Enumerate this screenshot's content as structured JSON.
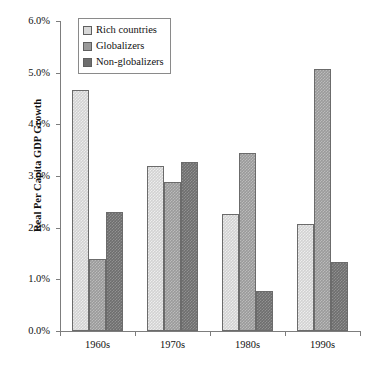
{
  "header": {
    "clipped_fragments": [
      "• •",
      "••",
      "• •"
    ]
  },
  "legend": {
    "position": "top-left-inside",
    "items": [
      {
        "label": "Rich countries",
        "color": "#d8d8d8"
      },
      {
        "label": "Globalizers",
        "color": "#9a9a9a"
      },
      {
        "label": "Non-globalizers",
        "color": "#6e6e6e"
      }
    ]
  },
  "axis": {
    "y_title": "Real Per Capita GDP Growth",
    "y_ticks": [
      "0.0%",
      "1.0%",
      "2.0%",
      "3.0%",
      "4.0%",
      "5.0%",
      "6.0%"
    ],
    "x_ticks": [
      "1960s",
      "1970s",
      "1980s",
      "1990s"
    ]
  },
  "chart_data": {
    "type": "bar",
    "title": "",
    "subtitle": "",
    "xlabel": "",
    "ylabel": "Real Per Capita GDP Growth",
    "categories": [
      "1960s",
      "1970s",
      "1980s",
      "1990s"
    ],
    "series": [
      {
        "name": "Rich countries",
        "color": "#d2d2d2",
        "values": [
          4.66,
          3.19,
          2.27,
          2.07
        ]
      },
      {
        "name": "Globalizers",
        "color": "#9a9a9a",
        "values": [
          1.39,
          2.89,
          3.45,
          5.07
        ]
      },
      {
        "name": "Non-globalizers",
        "color": "#6e6e6e",
        "values": [
          2.3,
          3.27,
          0.77,
          1.34
        ]
      }
    ],
    "ylim": [
      0,
      6
    ],
    "ytick_step": 1,
    "value_unit": "percent",
    "grid": false,
    "legend_position": "upper-left"
  }
}
